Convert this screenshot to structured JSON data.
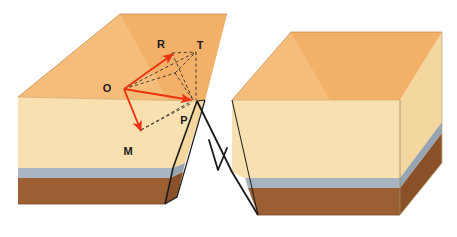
{
  "figure": {
    "type": "geological-block-diagram",
    "width": 457,
    "height": 237,
    "background": "#ffffff"
  },
  "palette": {
    "top_surface": "#f6bd7a",
    "top_surface_shade": "#f2b068",
    "front_face_upper": "#f8e0b0",
    "side_face_upper": "#f3d79f",
    "marker_bed": "#a8b5c0",
    "marker_bed_side": "#97a5b2",
    "basal_layer": "#9b5f33",
    "basal_layer_side": "#8a5129",
    "outline": "#1a1a1a",
    "vector_red": "#ee3311",
    "construction_dash": "#33302c"
  },
  "strata": [
    {
      "name": "surface",
      "label": "top surface",
      "color": "#f6bd7a"
    },
    {
      "name": "upper-unit",
      "label": "upper sandstone unit",
      "color": "#f8e0b0"
    },
    {
      "name": "marker-bed",
      "label": "blue-gray marker bed",
      "color": "#a8b5c0"
    },
    {
      "name": "basal-unit",
      "label": "basal brown unit",
      "color": "#9b5f33"
    }
  ],
  "blocks": [
    {
      "name": "footwall-block",
      "label": "left upthrown block",
      "side": "left"
    },
    {
      "name": "hangingwall-block",
      "label": "right downthrown block",
      "side": "right"
    }
  ],
  "fault": {
    "name": "normal-fault",
    "label": "fault plane",
    "sense_symbol": "V"
  },
  "labels": {
    "origin": "O",
    "net_slip": "R",
    "strike_slip": "T",
    "perpendicular": "P",
    "dip_slip": "M",
    "fault_sense": "V"
  },
  "vectors": [
    {
      "name": "vector-O-to-R",
      "from": "O",
      "to": "R",
      "style": "solid-arrow",
      "color": "#ee3311"
    },
    {
      "name": "vector-O-to-N",
      "from": "O",
      "to": "fault-intersection",
      "style": "solid-arrow",
      "color": "#ee3311"
    },
    {
      "name": "vector-O-to-M",
      "from": "O",
      "to": "M",
      "style": "solid-arrow",
      "color": "#ee3311"
    }
  ],
  "construction_lines": [
    {
      "name": "dash-R-to-T",
      "from": "R",
      "to": "T"
    },
    {
      "name": "dash-T-to-N",
      "from": "T",
      "to": "fault-intersection"
    },
    {
      "name": "dash-O-to-T",
      "from": "O",
      "to": "T"
    },
    {
      "name": "dash-R-to-N",
      "from": "R",
      "to": "fault-intersection"
    },
    {
      "name": "dash-M-to-P",
      "from": "M",
      "to": "P"
    },
    {
      "name": "dash-P-to-N",
      "from": "P",
      "to": "fault-intersection"
    }
  ]
}
